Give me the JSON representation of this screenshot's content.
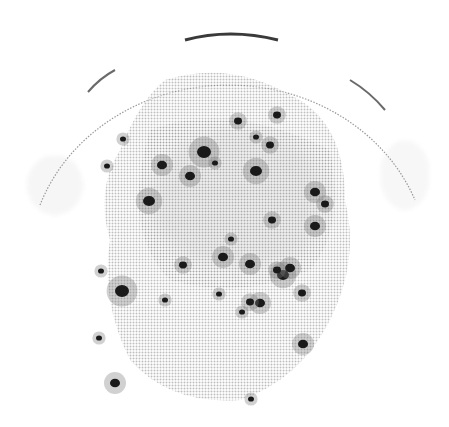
{
  "image": {
    "subject": "petri dish with dark colony spots",
    "style": "grayscale halftone",
    "background": "#ffffff",
    "dish": {
      "cx": 226,
      "cy": 255,
      "r": 212,
      "rim_color": "#555555"
    },
    "haze_color": "#b8b8b8",
    "spot_color": "#1a1a1a",
    "spots": [
      {
        "x": 238,
        "y": 121,
        "r": 4
      },
      {
        "x": 277,
        "y": 115,
        "r": 4
      },
      {
        "x": 256,
        "y": 137,
        "r": 3
      },
      {
        "x": 204,
        "y": 152,
        "r": 7
      },
      {
        "x": 256,
        "y": 171,
        "r": 6
      },
      {
        "x": 190,
        "y": 176,
        "r": 5
      },
      {
        "x": 162,
        "y": 165,
        "r": 5
      },
      {
        "x": 149,
        "y": 201,
        "r": 6
      },
      {
        "x": 270,
        "y": 145,
        "r": 4
      },
      {
        "x": 215,
        "y": 163,
        "r": 3
      },
      {
        "x": 315,
        "y": 192,
        "r": 5
      },
      {
        "x": 325,
        "y": 204,
        "r": 4
      },
      {
        "x": 123,
        "y": 139,
        "r": 3
      },
      {
        "x": 107,
        "y": 166,
        "r": 3
      },
      {
        "x": 272,
        "y": 220,
        "r": 4
      },
      {
        "x": 315,
        "y": 226,
        "r": 5
      },
      {
        "x": 231,
        "y": 239,
        "r": 3
      },
      {
        "x": 223,
        "y": 257,
        "r": 5
      },
      {
        "x": 250,
        "y": 264,
        "r": 5
      },
      {
        "x": 283,
        "y": 275,
        "r": 6
      },
      {
        "x": 290,
        "y": 268,
        "r": 5
      },
      {
        "x": 277,
        "y": 270,
        "r": 4
      },
      {
        "x": 183,
        "y": 265,
        "r": 4
      },
      {
        "x": 302,
        "y": 293,
        "r": 4
      },
      {
        "x": 260,
        "y": 303,
        "r": 5
      },
      {
        "x": 250,
        "y": 302,
        "r": 4
      },
      {
        "x": 242,
        "y": 312,
        "r": 3
      },
      {
        "x": 122,
        "y": 291,
        "r": 7
      },
      {
        "x": 101,
        "y": 271,
        "r": 3
      },
      {
        "x": 99,
        "y": 338,
        "r": 3
      },
      {
        "x": 303,
        "y": 344,
        "r": 5
      },
      {
        "x": 115,
        "y": 383,
        "r": 5
      },
      {
        "x": 251,
        "y": 399,
        "r": 3
      },
      {
        "x": 219,
        "y": 294,
        "r": 3
      },
      {
        "x": 165,
        "y": 300,
        "r": 3
      }
    ]
  }
}
